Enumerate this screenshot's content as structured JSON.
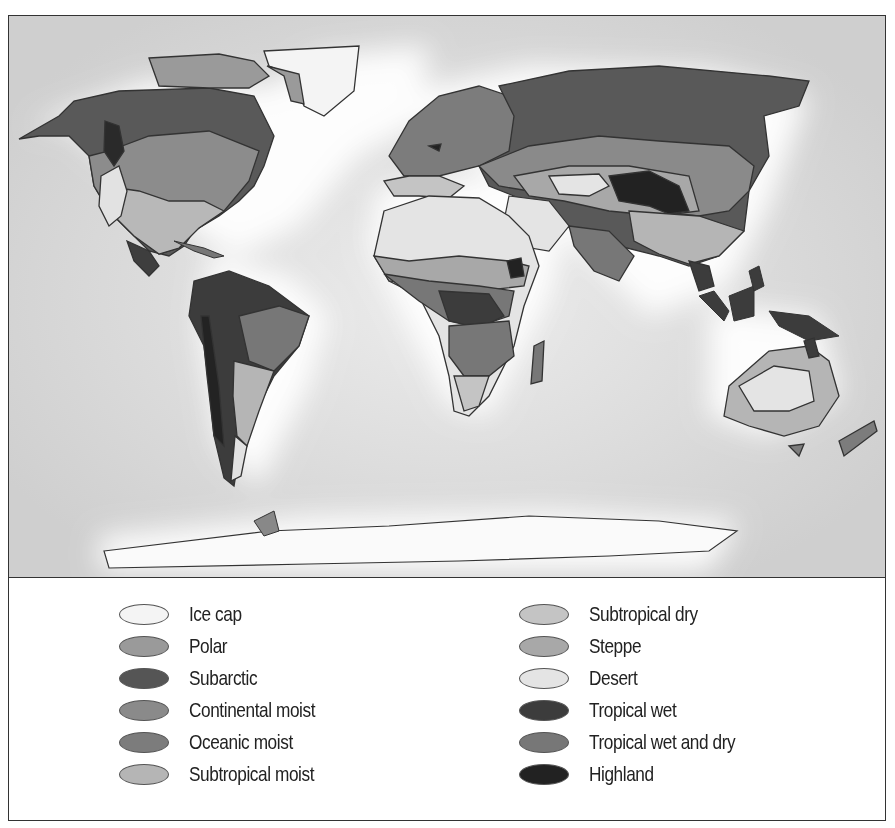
{
  "map": {
    "title": "World climate regions",
    "ocean_color": "#d4d4d4",
    "outline_color": "#333333"
  },
  "legend": {
    "left_column": [
      {
        "label": "Ice cap",
        "color": "#f4f4f4",
        "key": "ice-cap"
      },
      {
        "label": "Polar",
        "color": "#9a9a9a",
        "key": "polar"
      },
      {
        "label": "Subarctic",
        "color": "#555555",
        "key": "subarctic"
      },
      {
        "label": "Continental moist",
        "color": "#8a8a8a",
        "key": "continental-moist"
      },
      {
        "label": "Oceanic moist",
        "color": "#7c7c7c",
        "key": "oceanic-moist"
      },
      {
        "label": "Subtropical moist",
        "color": "#b5b5b5",
        "key": "subtropical-moist"
      }
    ],
    "right_column": [
      {
        "label": "Subtropical dry",
        "color": "#c4c4c4",
        "key": "subtropical-dry"
      },
      {
        "label": "Steppe",
        "color": "#a8a8a8",
        "key": "steppe"
      },
      {
        "label": "Desert",
        "color": "#e4e4e4",
        "key": "desert"
      },
      {
        "label": "Tropical wet",
        "color": "#3c3c3c",
        "key": "tropical-wet"
      },
      {
        "label": "Tropical wet and dry",
        "color": "#777777",
        "key": "tropical-wet-and-dry"
      },
      {
        "label": "Highland",
        "color": "#222222",
        "key": "highland"
      }
    ]
  }
}
